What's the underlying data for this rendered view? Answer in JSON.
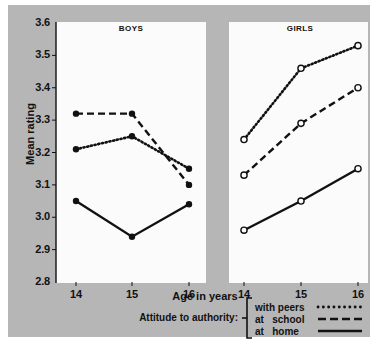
{
  "chart_data": {
    "type": "line",
    "title": "",
    "xlabel": "Age in years",
    "ylabel": "Mean rating",
    "ylim": [
      2.8,
      3.6
    ],
    "ytick_labels": [
      "3.6",
      "3.5",
      "3.4",
      "3.3",
      "3.2",
      "3.1",
      "3.0",
      "2.9",
      "2.8"
    ],
    "ytick_values": [
      3.6,
      3.5,
      3.4,
      3.3,
      3.2,
      3.1,
      3.0,
      2.9,
      2.8
    ],
    "grid": false,
    "legend_position": "below-right",
    "legend_caption": "Attitude to authority:",
    "x": [
      14,
      15,
      16
    ],
    "xtick_labels": [
      "14",
      "15",
      "16"
    ],
    "panels": [
      {
        "name": "BOYS",
        "marker": "filled-circle",
        "series": [
          {
            "name": "with peers",
            "style": "dotted",
            "values": [
              3.21,
              3.25,
              3.15
            ]
          },
          {
            "name": "at   school",
            "style": "dashed",
            "values": [
              3.32,
              3.32,
              3.1
            ]
          },
          {
            "name": "at   home",
            "style": "solid",
            "values": [
              3.05,
              2.94,
              3.04
            ]
          }
        ]
      },
      {
        "name": "GIRLS",
        "marker": "open-circle",
        "series": [
          {
            "name": "with peers",
            "style": "dotted",
            "values": [
              3.24,
              3.46,
              3.53
            ]
          },
          {
            "name": "at   school",
            "style": "dashed",
            "values": [
              3.13,
              3.29,
              3.4
            ]
          },
          {
            "name": "at   home",
            "style": "solid",
            "values": [
              2.96,
              3.05,
              3.15
            ]
          }
        ]
      }
    ],
    "legend_entries": [
      {
        "label": "with peers",
        "style": "dotted"
      },
      {
        "label": "at   school",
        "style": "dashed"
      },
      {
        "label": "at   home",
        "style": "solid"
      }
    ],
    "colors": {
      "background": "#b6b6b6",
      "panel": "#fbfbfb",
      "ink": "#111111"
    }
  }
}
